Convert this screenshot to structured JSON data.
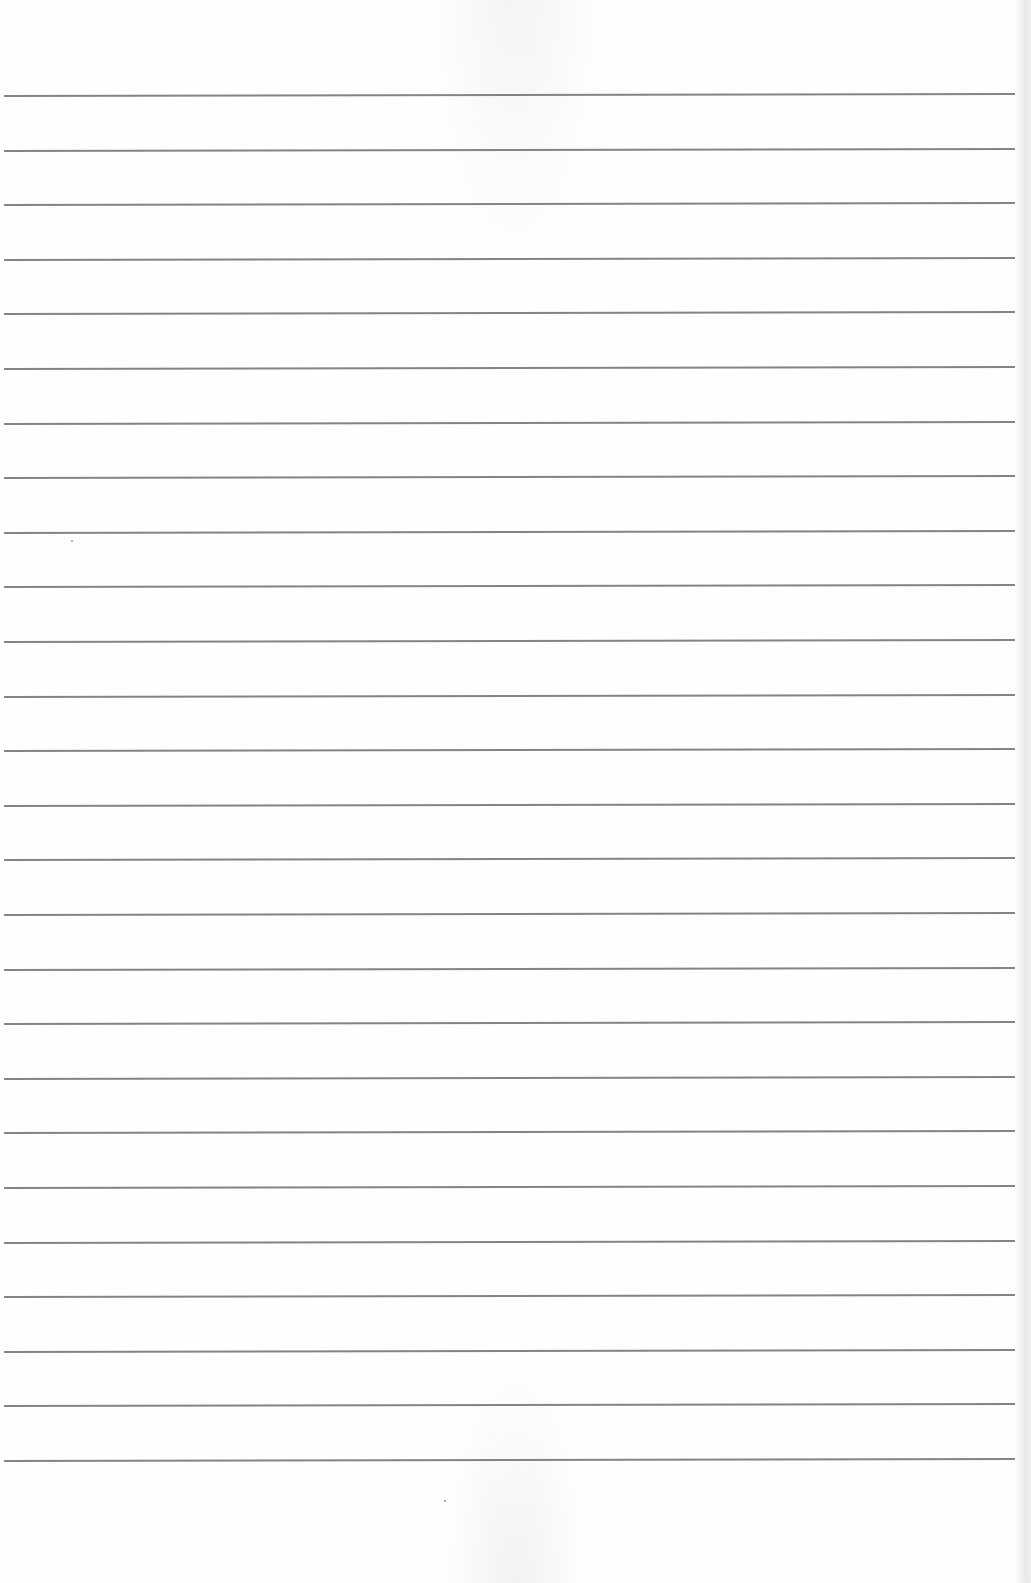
{
  "document": {
    "type": "ruled-paper",
    "text_content": "",
    "paper_color": "#fefefe",
    "rule_color": "#6e6e6e",
    "rule_count": 26,
    "first_rule_y": 95,
    "rule_spacing": 54.6,
    "rule_right_edge": 1015
  }
}
